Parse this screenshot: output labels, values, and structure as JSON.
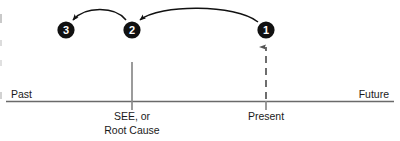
{
  "figure": {
    "type": "timeline-diagram",
    "background_color": "#ffffff",
    "line_color": "#4a4a4a",
    "node_fill": "#111111",
    "node_text_color": "#ffffff",
    "text_color": "#1a1a1a"
  },
  "axis": {
    "left_label": "Past",
    "right_label": "Future"
  },
  "ticks": [
    {
      "id": "see-root-cause",
      "label_line1": "SEE, or",
      "label_line2": "Root Cause",
      "style": "solid"
    },
    {
      "id": "present",
      "label_line1": "Present",
      "label_line2": "",
      "style": "dashed-arrow"
    }
  ],
  "nodes": [
    {
      "id": "node-3",
      "label": "3"
    },
    {
      "id": "node-2",
      "label": "2"
    },
    {
      "id": "node-1",
      "label": "1"
    }
  ],
  "arrows": [
    {
      "id": "arrow-1-to-2",
      "from": "node-1",
      "to": "node-2",
      "style": "curved"
    },
    {
      "id": "arrow-2-to-3",
      "from": "node-2",
      "to": "node-3",
      "style": "curved"
    }
  ]
}
